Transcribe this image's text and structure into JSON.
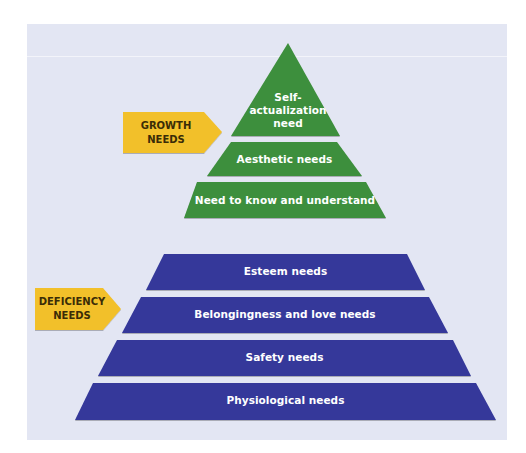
{
  "colors": {
    "panel_bg": "#e3e6f3",
    "growth_green": "#3e8f3c",
    "deficiency_blue": "#35399a",
    "tag_yellow": "#f2c02b",
    "label_text": "#ffffff",
    "tag_text": "#3a2c07"
  },
  "diagram": {
    "title": "",
    "growth": {
      "tag": {
        "line1": "GROWTH",
        "line2": "NEEDS"
      },
      "tiers": [
        {
          "line1": "Self-",
          "line2": "actualization",
          "line3": "need"
        },
        {
          "label": "Aesthetic needs"
        },
        {
          "label": "Need to know and understand"
        }
      ]
    },
    "deficiency": {
      "tag": {
        "line1": "DEFICIENCY",
        "line2": "NEEDS"
      },
      "tiers": [
        {
          "label": "Esteem needs"
        },
        {
          "label": "Belongingness and love needs"
        },
        {
          "label": "Safety needs"
        },
        {
          "label": "Physiological needs"
        }
      ]
    }
  }
}
